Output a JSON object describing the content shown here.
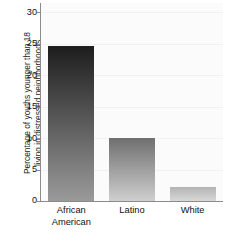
{
  "chart_data": {
    "type": "bar",
    "title": "",
    "xlabel": "",
    "ylabel_lines": [
      "Percentage of youths younger than 18",
      "living in distressed neighborhoods"
    ],
    "ylabel": "Percentage of youths younger than 18 living in distressed neighborhoods",
    "categories": [
      "African American",
      "Latino",
      "White"
    ],
    "category_lines": [
      [
        "African",
        "American"
      ],
      [
        "Latino",
        ""
      ],
      [
        "White",
        ""
      ]
    ],
    "values": [
      24.7,
      10.0,
      2.2
    ],
    "ylim": [
      0,
      31.5
    ],
    "yticks": [
      0,
      5,
      10,
      15,
      20,
      25,
      30
    ],
    "ytick_labels": [
      "0",
      "5",
      "10",
      "15",
      "20",
      "25",
      "30"
    ],
    "grid": true,
    "legend": "none",
    "bar_style": "vertical-gradient-dark-to-light",
    "colors": {
      "bar_top": [
        "#1d1d1d",
        "#6f6f6f",
        "#b4b4b4"
      ],
      "bar_bottom": [
        "#9a9a9a",
        "#cfcfcf",
        "#d8d8d8"
      ],
      "axis": "#8c8c8c",
      "grid": "#f1f1f1",
      "plot_background": "#fbfbfb",
      "text": "#111111"
    }
  }
}
